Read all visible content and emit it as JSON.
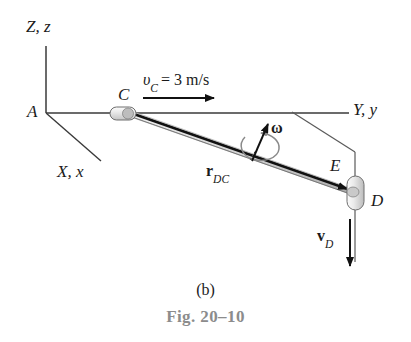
{
  "figure": {
    "part_label": "(b)",
    "figure_number": "Fig. 20–10",
    "domain_note": "mechanics kinematics diagram"
  },
  "axes": {
    "z_label": "Z, z",
    "x_label": "X, x",
    "y_label": "Y, y",
    "origin_label": "A"
  },
  "points": {
    "c": "C",
    "d": "D",
    "e": "E"
  },
  "vectors": {
    "vc_symbol": "υ",
    "vc_subscript": "C",
    "vc_equals": "= 3 m/s",
    "vc_full": "υC = 3 m/s",
    "omega_symbol": "ω",
    "rdc_symbol": "r",
    "rdc_subscript": "DC",
    "vd_symbol": "v",
    "vd_subscript": "D"
  },
  "colors": {
    "line": "#3a3a3a",
    "rod_fill": "#d9d9d9",
    "rod_edge": "#111111",
    "collar_fill": "#e3e3e3",
    "collar_edge": "#6e6e6e",
    "omega_curve": "#8a8a8a",
    "caption_gray": "#8c8c8c",
    "text": "#1a1a1a",
    "background": "#ffffff"
  },
  "geometry": {
    "origin_a": [
      46,
      113
    ],
    "z_axis_top": [
      46,
      46
    ],
    "x_axis_end": [
      101,
      161
    ],
    "y_axis_end": [
      349,
      113
    ],
    "collar_c": [
      124,
      115
    ],
    "collar_d": [
      354,
      193
    ],
    "guide_corner": [
      355,
      152
    ],
    "rod_start": [
      131,
      114
    ],
    "rod_end": [
      353,
      192
    ],
    "vc_arrow": [
      143,
      98,
      216,
      98
    ],
    "vd_arrow": [
      350,
      222,
      350,
      268
    ],
    "omega_arrow": [
      252,
      163,
      268,
      124
    ]
  }
}
